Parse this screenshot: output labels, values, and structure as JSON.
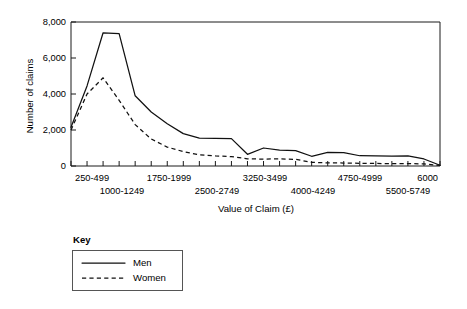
{
  "chart_data": {
    "type": "line",
    "title": "",
    "xlabel": "Value of Claim (£)",
    "ylabel": "Number of claims",
    "ylim": [
      0,
      8000
    ],
    "yticks": [
      0,
      2000,
      4000,
      6000,
      8000
    ],
    "ytick_labels": [
      "0",
      "2,000",
      "4,000",
      "6,000",
      "8,000"
    ],
    "grid": false,
    "legend_position": "below-left",
    "x_index_count": 24,
    "xtick_labels_row1": [
      "250-499",
      "1750-1999",
      "3250-3499",
      "4750-4999",
      "6000"
    ],
    "xtick_labels_row2": [
      "1000-1249",
      "2500-2749",
      "4000-4249",
      "5500-5749"
    ],
    "xtick_row1_positions": [
      0,
      6,
      12,
      18,
      23
    ],
    "xtick_row2_positions": [
      3,
      9,
      15,
      21
    ],
    "categories": [
      "250-499",
      "500-749",
      "750-999",
      "1000-1249",
      "1250-1499",
      "1500-1749",
      "1750-1999",
      "2000-2249",
      "2250-2499",
      "2500-2749",
      "2750-2999",
      "3000-3249",
      "3250-3499",
      "3500-3749",
      "3750-3999",
      "4000-4249",
      "4250-4499",
      "4500-4749",
      "4750-4999",
      "5000-5249",
      "5250-5499",
      "5500-5749",
      "5750-5999",
      "6000"
    ],
    "series": [
      {
        "name": "Men",
        "style": "solid",
        "values": [
          2150,
          4450,
          7400,
          7350,
          3900,
          3000,
          2350,
          1800,
          1550,
          1540,
          1520,
          650,
          1000,
          880,
          850,
          540,
          760,
          740,
          570,
          560,
          555,
          560,
          390,
          40
        ]
      },
      {
        "name": "Women",
        "style": "dashed",
        "values": [
          2000,
          4000,
          4900,
          3650,
          2300,
          1500,
          1050,
          800,
          620,
          560,
          520,
          400,
          380,
          400,
          370,
          200,
          175,
          165,
          150,
          140,
          135,
          130,
          120,
          30
        ]
      }
    ]
  },
  "axes": {
    "y_axis_title": "Number of claims",
    "x_axis_title": "Value of Claim (£)",
    "y_tick_0": "0",
    "y_tick_2000": "2,000",
    "y_tick_4000": "4,000",
    "y_tick_6000": "6,000",
    "y_tick_8000": "8,000",
    "x_tick_a": "250-499",
    "x_tick_b": "1000-1249",
    "x_tick_c": "1750-1999",
    "x_tick_d": "2500-2749",
    "x_tick_e": "3250-3499",
    "x_tick_f": "4000-4249",
    "x_tick_g": "4750-4999",
    "x_tick_h": "5500-5749",
    "x_tick_i": "6000"
  },
  "legend": {
    "title": "Key",
    "entries": [
      {
        "label": "Men",
        "style": "solid"
      },
      {
        "label": "Women",
        "style": "dashed"
      }
    ],
    "men_label": "Men",
    "women_label": "Women"
  },
  "colors": {
    "line": "#111111",
    "frame": "#1a1a1a",
    "legend_border": "#555555",
    "background": "#ffffff"
  }
}
